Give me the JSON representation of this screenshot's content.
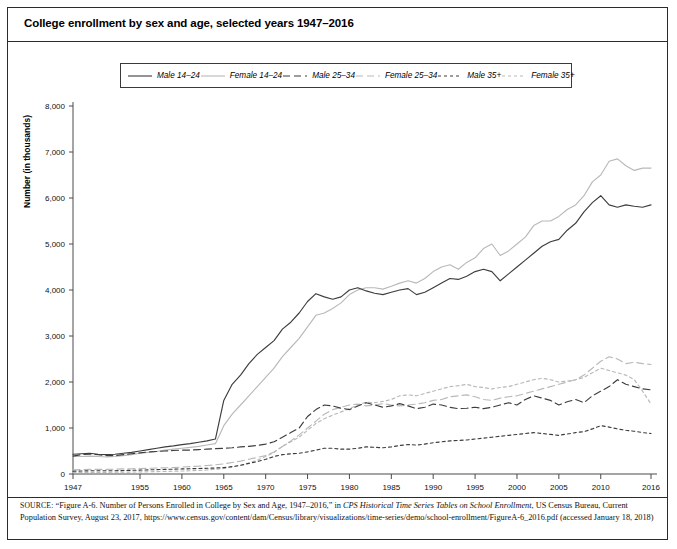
{
  "figure": {
    "title": "College enrollment by sex and age, selected years 1947–2016",
    "ylabel": "Number (in thousands)"
  },
  "legend": {
    "position": "top-center",
    "items": [
      {
        "label": "Male 14–24",
        "key": "solid-dark",
        "color": "#3d3d3d",
        "dash": "none"
      },
      {
        "label": "Female 14–24",
        "key": "solid-light",
        "color": "#b9b9b9",
        "dash": "none"
      },
      {
        "label": "Male 25–34",
        "key": "dashed-dark",
        "color": "#3d3d3d",
        "dash": "7,4"
      },
      {
        "label": "Female 25–34",
        "key": "dashed-light",
        "color": "#b9b9b9",
        "dash": "7,4"
      },
      {
        "label": "Male 35+",
        "key": "dotted-dark",
        "color": "#3d3d3d",
        "dash": "3,3"
      },
      {
        "label": "Female 35+",
        "key": "dotted-light",
        "color": "#b9b9b9",
        "dash": "3,3"
      }
    ]
  },
  "source": {
    "label": "SOURCE:",
    "line1a": " “Figure A-6. Number of Persons Enrolled in College by Sex and Age, 1947–2016,” in ",
    "line1_italic": "CPS Historical Time Series Tables on School Enrollment",
    "line2": ", US Census Bureau, Current Population Survey, August 23, 2017, https://www.census.gov/content/dam/Census/library/visualizations/time-series/demo/school-enrollment/FigureA-6_2016.pdf (accessed January 18, 2018)"
  },
  "chart_data": {
    "type": "line",
    "title": "College enrollment by sex and age, selected years 1947–2016",
    "xlabel": "",
    "ylabel": "Number (in thousands)",
    "xlim": [
      1947,
      2016
    ],
    "ylim": [
      0,
      8000
    ],
    "yticks": [
      0,
      1000,
      2000,
      3000,
      4000,
      5000,
      6000,
      7000,
      8000
    ],
    "ytick_labels": [
      "0",
      "1,000",
      "2,000",
      "3,000",
      "4,000",
      "5,000",
      "6,000",
      "7,000",
      "8,000"
    ],
    "xticks": [
      1947,
      1955,
      1960,
      1965,
      1970,
      1975,
      1980,
      1985,
      1990,
      1995,
      2000,
      2005,
      2010,
      2016
    ],
    "xtick_labels": [
      "1947",
      "1955",
      "1960",
      "1965",
      "1970",
      "1975",
      "1980",
      "1985",
      "1990",
      "1995",
      "2000",
      "2005",
      "2010",
      "2016"
    ],
    "grid": false,
    "legend_position": "top-center",
    "x": [
      1947,
      1948,
      1949,
      1950,
      1951,
      1952,
      1953,
      1954,
      1955,
      1956,
      1957,
      1958,
      1959,
      1960,
      1961,
      1962,
      1963,
      1964,
      1965,
      1966,
      1967,
      1968,
      1969,
      1970,
      1971,
      1972,
      1973,
      1974,
      1975,
      1976,
      1977,
      1978,
      1979,
      1980,
      1981,
      1982,
      1983,
      1984,
      1985,
      1986,
      1987,
      1988,
      1989,
      1990,
      1991,
      1992,
      1993,
      1994,
      1995,
      1996,
      1997,
      1998,
      1999,
      2000,
      2001,
      2002,
      2003,
      2004,
      2005,
      2006,
      2007,
      2008,
      2009,
      2010,
      2011,
      2012,
      2013,
      2014,
      2015,
      2016
    ],
    "series": [
      {
        "name": "Male 14–24",
        "color": "#3d3d3d",
        "dash": "none",
        "values": [
          430,
          440,
          450,
          430,
          420,
          430,
          450,
          470,
          500,
          530,
          560,
          590,
          610,
          640,
          660,
          690,
          720,
          760,
          1600,
          1950,
          2150,
          2400,
          2600,
          2750,
          2900,
          3150,
          3300,
          3500,
          3750,
          3920,
          3850,
          3800,
          3850,
          4000,
          4050,
          3980,
          3930,
          3900,
          3950,
          4000,
          4030,
          3900,
          3950,
          4050,
          4150,
          4250,
          4230,
          4300,
          4400,
          4450,
          4400,
          4200,
          4350,
          4500,
          4650,
          4800,
          4950,
          5050,
          5100,
          5300,
          5450,
          5700,
          5900,
          6050,
          5850,
          5800,
          5850,
          5820,
          5800,
          5850
        ]
      },
      {
        "name": "Female 14–24",
        "color": "#b9b9b9",
        "dash": "none",
        "values": [
          380,
          380,
          390,
          380,
          370,
          380,
          400,
          420,
          450,
          470,
          490,
          520,
          540,
          560,
          580,
          600,
          630,
          660,
          1050,
          1300,
          1500,
          1700,
          1900,
          2100,
          2300,
          2550,
          2750,
          2950,
          3200,
          3450,
          3500,
          3600,
          3720,
          3900,
          4000,
          4050,
          4050,
          4020,
          4080,
          4150,
          4200,
          4150,
          4250,
          4400,
          4500,
          4550,
          4450,
          4600,
          4700,
          4900,
          5000,
          4750,
          4850,
          5000,
          5150,
          5400,
          5500,
          5500,
          5600,
          5750,
          5850,
          6050,
          6350,
          6500,
          6800,
          6850,
          6700,
          6600,
          6650,
          6650
        ]
      },
      {
        "name": "Male 25–34",
        "color": "#3d3d3d",
        "dash": "7,4",
        "values": [
          390,
          420,
          430,
          420,
          400,
          400,
          420,
          440,
          460,
          480,
          490,
          500,
          510,
          520,
          520,
          530,
          540,
          550,
          560,
          570,
          590,
          600,
          620,
          650,
          700,
          800,
          900,
          1000,
          1250,
          1400,
          1500,
          1480,
          1430,
          1400,
          1480,
          1550,
          1500,
          1450,
          1480,
          1530,
          1480,
          1420,
          1450,
          1520,
          1500,
          1450,
          1420,
          1430,
          1450,
          1420,
          1450,
          1500,
          1550,
          1500,
          1620,
          1700,
          1650,
          1600,
          1500,
          1570,
          1620,
          1550,
          1700,
          1800,
          1900,
          2050,
          1950,
          1900,
          1850,
          1830
        ]
      },
      {
        "name": "Female 25–34",
        "color": "#b9b9b9",
        "dash": "7,4",
        "values": [
          90,
          95,
          100,
          100,
          100,
          105,
          110,
          115,
          120,
          125,
          130,
          135,
          140,
          150,
          160,
          170,
          185,
          200,
          220,
          250,
          280,
          320,
          360,
          400,
          480,
          600,
          720,
          850,
          1000,
          1150,
          1300,
          1400,
          1450,
          1500,
          1520,
          1480,
          1500,
          1530,
          1500,
          1480,
          1500,
          1520,
          1550,
          1600,
          1620,
          1680,
          1700,
          1720,
          1680,
          1620,
          1600,
          1650,
          1680,
          1700,
          1750,
          1800,
          1850,
          1900,
          1950,
          2000,
          2050,
          2150,
          2300,
          2450,
          2550,
          2500,
          2400,
          2430,
          2400,
          2380
        ]
      },
      {
        "name": "Male 35+",
        "color": "#3d3d3d",
        "dash": "3,3",
        "values": [
          60,
          65,
          70,
          70,
          70,
          70,
          75,
          80,
          85,
          90,
          95,
          100,
          105,
          110,
          115,
          120,
          125,
          130,
          140,
          160,
          190,
          230,
          270,
          320,
          380,
          420,
          440,
          450,
          480,
          520,
          560,
          560,
          540,
          540,
          560,
          590,
          580,
          570,
          590,
          620,
          640,
          630,
          650,
          680,
          700,
          720,
          730,
          740,
          760,
          780,
          800,
          820,
          840,
          860,
          880,
          900,
          880,
          860,
          840,
          870,
          900,
          920,
          980,
          1050,
          1020,
          980,
          950,
          930,
          900,
          880
        ]
      },
      {
        "name": "Female 35+",
        "color": "#b9b9b9",
        "dash": "3,3",
        "values": [
          30,
          32,
          35,
          35,
          35,
          38,
          40,
          42,
          45,
          48,
          52,
          56,
          60,
          65,
          70,
          78,
          88,
          100,
          120,
          150,
          190,
          240,
          300,
          380,
          470,
          600,
          700,
          800,
          950,
          1100,
          1200,
          1280,
          1350,
          1420,
          1500,
          1560,
          1550,
          1580,
          1620,
          1700,
          1720,
          1700,
          1750,
          1800,
          1850,
          1900,
          1920,
          1950,
          1900,
          1880,
          1850,
          1880,
          1900,
          1950,
          2000,
          2050,
          2080,
          2050,
          2000,
          2020,
          2050,
          2100,
          2200,
          2300,
          2250,
          2200,
          2150,
          2050,
          1800,
          1520
        ]
      }
    ]
  }
}
